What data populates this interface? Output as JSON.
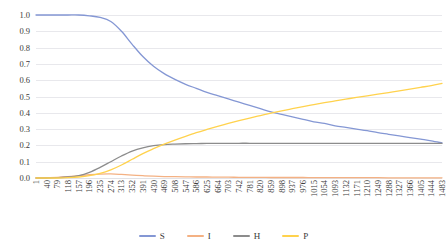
{
  "chart_data": {
    "type": "line",
    "title": "",
    "xlabel": "",
    "ylabel": "",
    "ylim": [
      0.0,
      1.0
    ],
    "xlim": [
      1,
      1483
    ],
    "grid": true,
    "legend_position": "bottom",
    "y_ticks": [
      "1.0",
      "0.9",
      "0.8",
      "0.7",
      "0.6",
      "0.5",
      "0.4",
      "0.3",
      "0.2",
      "0.1",
      "0.0"
    ],
    "y_tick_values": [
      1.0,
      0.9,
      0.8,
      0.7,
      0.6,
      0.5,
      0.4,
      0.3,
      0.2,
      0.1,
      0.0
    ],
    "categories": [
      1,
      40,
      79,
      118,
      157,
      196,
      235,
      274,
      313,
      352,
      391,
      430,
      469,
      508,
      547,
      586,
      625,
      664,
      703,
      742,
      781,
      820,
      859,
      898,
      937,
      976,
      1015,
      1054,
      1093,
      1132,
      1171,
      1210,
      1249,
      1288,
      1327,
      1366,
      1405,
      1444,
      1483
    ],
    "series": [
      {
        "name": "S",
        "color": "#8497d4",
        "values": [
          1.0,
          1.0,
          1.0,
          1.0,
          1.0,
          0.995,
          0.985,
          0.96,
          0.9,
          0.82,
          0.745,
          0.685,
          0.64,
          0.605,
          0.575,
          0.55,
          0.525,
          0.505,
          0.485,
          0.465,
          0.445,
          0.425,
          0.405,
          0.39,
          0.375,
          0.36,
          0.345,
          0.335,
          0.32,
          0.31,
          0.3,
          0.29,
          0.278,
          0.268,
          0.258,
          0.248,
          0.238,
          0.228,
          0.215
        ]
      },
      {
        "name": "I",
        "color": "#f4b183",
        "values": [
          0.0,
          0.002,
          0.004,
          0.008,
          0.014,
          0.02,
          0.024,
          0.025,
          0.022,
          0.018,
          0.014,
          0.011,
          0.009,
          0.008,
          0.007,
          0.006,
          0.006,
          0.005,
          0.005,
          0.004,
          0.004,
          0.004,
          0.003,
          0.003,
          0.003,
          0.003,
          0.002,
          0.002,
          0.002,
          0.002,
          0.002,
          0.002,
          0.002,
          0.001,
          0.001,
          0.001,
          0.001,
          0.001,
          0.001
        ]
      },
      {
        "name": "H",
        "color": "#8c8c8c",
        "values": [
          0.0,
          0.0,
          0.002,
          0.006,
          0.015,
          0.035,
          0.065,
          0.1,
          0.135,
          0.165,
          0.185,
          0.198,
          0.205,
          0.208,
          0.21,
          0.211,
          0.212,
          0.212,
          0.212,
          0.213,
          0.213,
          0.213,
          0.213,
          0.213,
          0.213,
          0.213,
          0.213,
          0.213,
          0.213,
          0.213,
          0.213,
          0.213,
          0.213,
          0.213,
          0.213,
          0.213,
          0.213,
          0.213,
          0.213
        ]
      },
      {
        "name": "P",
        "color": "#ffd24d",
        "values": [
          0.0,
          0.0,
          0.0,
          0.002,
          0.006,
          0.014,
          0.028,
          0.05,
          0.08,
          0.115,
          0.15,
          0.18,
          0.208,
          0.233,
          0.256,
          0.278,
          0.298,
          0.317,
          0.335,
          0.352,
          0.368,
          0.383,
          0.398,
          0.412,
          0.425,
          0.438,
          0.45,
          0.462,
          0.473,
          0.484,
          0.494,
          0.504,
          0.514,
          0.524,
          0.534,
          0.545,
          0.556,
          0.567,
          0.58
        ]
      }
    ]
  },
  "legend": {
    "items": [
      {
        "label": "S",
        "color": "#8497d4"
      },
      {
        "label": "I",
        "color": "#f4b183"
      },
      {
        "label": "H",
        "color": "#8c8c8c"
      },
      {
        "label": "P",
        "color": "#ffd24d"
      }
    ]
  }
}
